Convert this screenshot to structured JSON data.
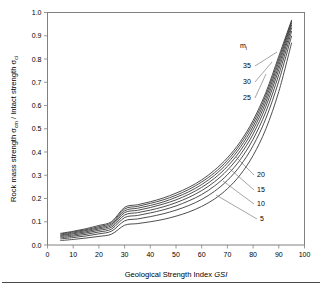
{
  "figure": {
    "background_color": "#ffffff",
    "frame_color": "#808080",
    "curve_color": "#3a3a3a",
    "footer_rule": true
  },
  "chart_data": {
    "type": "line",
    "title": "",
    "xlabel_prefix": "Geological Strength Index ",
    "xlabel_italic": "GSI",
    "ylabel_part1": "Rock mass strength  ",
    "ylabel_sigma1": "σ",
    "ylabel_sub1": "cm",
    "ylabel_part2": " / Intact strength  ",
    "ylabel_sigma2": "σ",
    "ylabel_sub2": "ci",
    "xlim": [
      0,
      100
    ],
    "ylim": [
      0.0,
      1.0
    ],
    "xticks": [
      0,
      10,
      20,
      30,
      40,
      50,
      60,
      70,
      80,
      90,
      100
    ],
    "yticks": [
      "0.0",
      "0.1",
      "0.2",
      "0.3",
      "0.4",
      "0.5",
      "0.6",
      "0.7",
      "0.8",
      "0.9",
      "1.0"
    ],
    "grid": false,
    "legend_position": "inside-right",
    "legend_title": "m",
    "legend_title_sub": "i",
    "x": [
      5,
      10,
      15,
      20,
      25,
      30,
      35,
      40,
      45,
      50,
      55,
      60,
      65,
      70,
      75,
      80,
      85,
      90,
      95
    ],
    "series": [
      {
        "name": "5",
        "label": "5",
        "values": [
          0.019,
          0.024,
          0.03,
          0.037,
          0.047,
          0.085,
          0.092,
          0.1,
          0.11,
          0.124,
          0.142,
          0.166,
          0.198,
          0.242,
          0.302,
          0.385,
          0.5,
          0.66,
          0.87
        ]
      },
      {
        "name": "10",
        "label": "10",
        "values": [
          0.026,
          0.032,
          0.039,
          0.048,
          0.06,
          0.104,
          0.112,
          0.122,
          0.134,
          0.15,
          0.17,
          0.196,
          0.231,
          0.278,
          0.341,
          0.427,
          0.545,
          0.705,
          0.9
        ]
      },
      {
        "name": "15",
        "label": "15",
        "values": [
          0.031,
          0.038,
          0.046,
          0.056,
          0.069,
          0.118,
          0.127,
          0.138,
          0.151,
          0.168,
          0.19,
          0.217,
          0.254,
          0.302,
          0.367,
          0.455,
          0.574,
          0.733,
          0.92
        ]
      },
      {
        "name": "20",
        "label": "20",
        "values": [
          0.036,
          0.043,
          0.052,
          0.063,
          0.077,
          0.129,
          0.139,
          0.15,
          0.164,
          0.182,
          0.205,
          0.234,
          0.272,
          0.322,
          0.388,
          0.477,
          0.597,
          0.755,
          0.935
        ]
      },
      {
        "name": "25",
        "label": "25",
        "values": [
          0.04,
          0.048,
          0.057,
          0.069,
          0.084,
          0.139,
          0.149,
          0.161,
          0.176,
          0.194,
          0.218,
          0.248,
          0.287,
          0.338,
          0.405,
          0.495,
          0.615,
          0.772,
          0.947
        ]
      },
      {
        "name": "30",
        "label": "30",
        "values": [
          0.043,
          0.052,
          0.062,
          0.074,
          0.09,
          0.147,
          0.158,
          0.17,
          0.185,
          0.205,
          0.229,
          0.26,
          0.3,
          0.352,
          0.42,
          0.51,
          0.631,
          0.787,
          0.956
        ]
      },
      {
        "name": "35",
        "label": "35",
        "values": [
          0.047,
          0.056,
          0.066,
          0.079,
          0.096,
          0.155,
          0.166,
          0.179,
          0.194,
          0.214,
          0.239,
          0.271,
          0.311,
          0.364,
          0.433,
          0.524,
          0.645,
          0.8,
          0.963
        ]
      },
      {
        "name": "40",
        "label": "",
        "values": [
          0.05,
          0.059,
          0.07,
          0.084,
          0.101,
          0.162,
          0.173,
          0.186,
          0.202,
          0.223,
          0.248,
          0.28,
          0.322,
          0.375,
          0.444,
          0.536,
          0.657,
          0.812,
          0.968
        ]
      }
    ],
    "annotations": [
      {
        "text": "35",
        "x_px": 243,
        "y_px": 68
      },
      {
        "text": "30",
        "x_px": 243,
        "y_px": 84
      },
      {
        "text": "25",
        "x_px": 243,
        "y_px": 100
      },
      {
        "text": "20",
        "x_px": 257,
        "y_px": 177
      },
      {
        "text": "15",
        "x_px": 257,
        "y_px": 192
      },
      {
        "text": "10",
        "x_px": 257,
        "y_px": 206
      },
      {
        "text": "5",
        "x_px": 260,
        "y_px": 221
      }
    ]
  }
}
